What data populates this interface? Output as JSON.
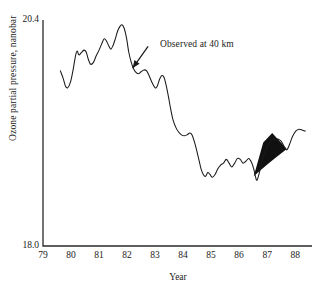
{
  "chart_data": {
    "type": "line",
    "title": "",
    "xlabel": "Year",
    "ylabel": "Ozone partial pressure, nanobar",
    "xlim": [
      79,
      88.6
    ],
    "ylim": [
      18.0,
      20.4
    ],
    "grid": false,
    "legend_position": "none",
    "x_tick_labels": [
      "79",
      "80",
      "81",
      "82",
      "83",
      "84",
      "85",
      "86",
      "87",
      "88"
    ],
    "x_ticks": [
      79,
      80,
      81,
      82,
      83,
      84,
      85,
      86,
      87,
      88
    ],
    "y_tick_labels": [
      "18.0",
      "20.4"
    ],
    "y_ticks": [
      18.0,
      20.4
    ],
    "line_color": "#1a1a1a",
    "fill_color": "#111111",
    "annotations": [
      {
        "text": "Observed at 40 km",
        "text_x": 82.85,
        "text_y": 20.18,
        "arrow_from_x": 82.75,
        "arrow_from_y": 20.12,
        "arrow_to_x": 82.2,
        "arrow_to_y": 19.89
      }
    ],
    "series": [
      {
        "name": "Observed at 40 km",
        "x": [
          79.62,
          79.72,
          79.8,
          79.88,
          79.98,
          80.08,
          80.16,
          80.22,
          80.28,
          80.36,
          80.46,
          80.54,
          80.62,
          80.7,
          80.8,
          80.9,
          81.0,
          81.1,
          81.18,
          81.26,
          81.34,
          81.42,
          81.5,
          81.58,
          81.66,
          81.74,
          81.82,
          81.9,
          81.98,
          82.06,
          82.14,
          82.22,
          82.3,
          82.4,
          82.5,
          82.6,
          82.7,
          82.8,
          82.9,
          83.0,
          83.08,
          83.16,
          83.24,
          83.32,
          83.4,
          83.48,
          83.56,
          83.64,
          83.74,
          83.84,
          83.94,
          84.04,
          84.14,
          84.24,
          84.32,
          84.4,
          84.48,
          84.56,
          84.64,
          84.72,
          84.8,
          84.88,
          84.96,
          85.04,
          85.14,
          85.24,
          85.34,
          85.44,
          85.54,
          85.64,
          85.74,
          85.84,
          85.94,
          86.04,
          86.14,
          86.24,
          86.34,
          86.44,
          86.52,
          86.58,
          86.64,
          86.74,
          86.86,
          87.0,
          87.16,
          87.32,
          87.48,
          87.6,
          87.7,
          87.8,
          87.9,
          88.02,
          88.14,
          88.26,
          88.36
        ],
        "y": [
          19.86,
          19.78,
          19.7,
          19.68,
          19.74,
          19.88,
          20.02,
          20.07,
          20.03,
          20.05,
          20.08,
          20.06,
          19.98,
          19.93,
          19.95,
          20.02,
          20.08,
          20.15,
          20.2,
          20.18,
          20.13,
          20.09,
          20.13,
          20.2,
          20.28,
          20.33,
          20.35,
          20.31,
          20.21,
          20.06,
          19.96,
          19.89,
          19.85,
          19.83,
          19.85,
          19.87,
          19.86,
          19.8,
          19.73,
          19.68,
          19.7,
          19.77,
          19.81,
          19.79,
          19.7,
          19.58,
          19.45,
          19.34,
          19.26,
          19.21,
          19.18,
          19.17,
          19.18,
          19.2,
          19.18,
          19.11,
          19.02,
          18.92,
          18.82,
          18.76,
          18.74,
          18.78,
          18.76,
          18.73,
          18.76,
          18.82,
          18.86,
          18.88,
          18.92,
          18.88,
          18.84,
          18.88,
          18.93,
          18.92,
          18.88,
          18.9,
          18.93,
          18.89,
          18.82,
          18.74,
          18.7,
          18.8,
          18.95,
          19.06,
          19.12,
          19.14,
          19.12,
          19.06,
          19.02,
          19.08,
          19.16,
          19.22,
          19.24,
          19.23,
          19.22
        ]
      }
    ],
    "filled_region": {
      "description": "solid black fan-shaped region",
      "x_start": 86.52,
      "x_end": 87.7,
      "y_min": 18.7,
      "y_max": 19.16
    }
  }
}
